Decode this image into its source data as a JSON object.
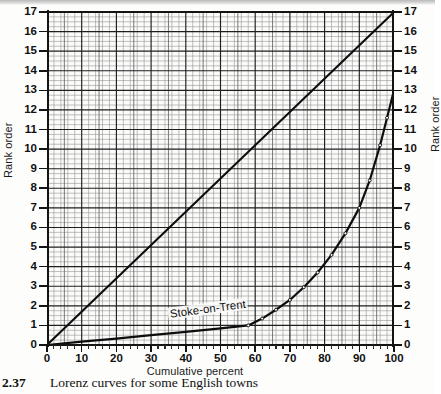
{
  "figure": {
    "caption_number": "2.37",
    "caption_text": "Lorenz curves for some English towns"
  },
  "axes": {
    "y_left_title": "Rank order",
    "y_right_title": "Rank order",
    "x_title": "Cumulative percent"
  },
  "annotations": {
    "lorenz_curve_label": "Stoke-on-Trent"
  },
  "chart_data": {
    "type": "line",
    "title": "Lorenz curves for some English towns",
    "xlabel": "Cumulative percent",
    "ylabel": "Rank order",
    "xlim": [
      0,
      100
    ],
    "ylim": [
      0,
      17
    ],
    "xticks": [
      0,
      10,
      20,
      30,
      40,
      50,
      60,
      70,
      80,
      90,
      100
    ],
    "yticks": [
      0,
      1,
      2,
      3,
      4,
      5,
      6,
      7,
      8,
      9,
      10,
      11,
      12,
      13,
      14,
      15,
      16,
      17
    ],
    "grid": true,
    "grid_minor_step_x": 2,
    "grid_minor_step_y": 0.25,
    "grid_major_step_x": 10,
    "grid_major_step_y": 1,
    "legend": "none",
    "series": [
      {
        "name": "Line of equal distribution",
        "style": "solid",
        "x": [
          0,
          100
        ],
        "y": [
          0,
          17
        ]
      },
      {
        "name": "Stoke-on-Trent",
        "style": "solid-with-points",
        "x": [
          0,
          10,
          20,
          30,
          40,
          50,
          58,
          62,
          66,
          70,
          74,
          78,
          82,
          86,
          90,
          93,
          96,
          98,
          100,
          100
        ],
        "y": [
          0,
          0.17,
          0.33,
          0.5,
          0.67,
          0.85,
          1.0,
          1.35,
          1.8,
          2.3,
          2.95,
          3.7,
          4.6,
          5.7,
          7.0,
          8.4,
          10.2,
          11.6,
          13.0,
          17.0
        ]
      }
    ]
  }
}
